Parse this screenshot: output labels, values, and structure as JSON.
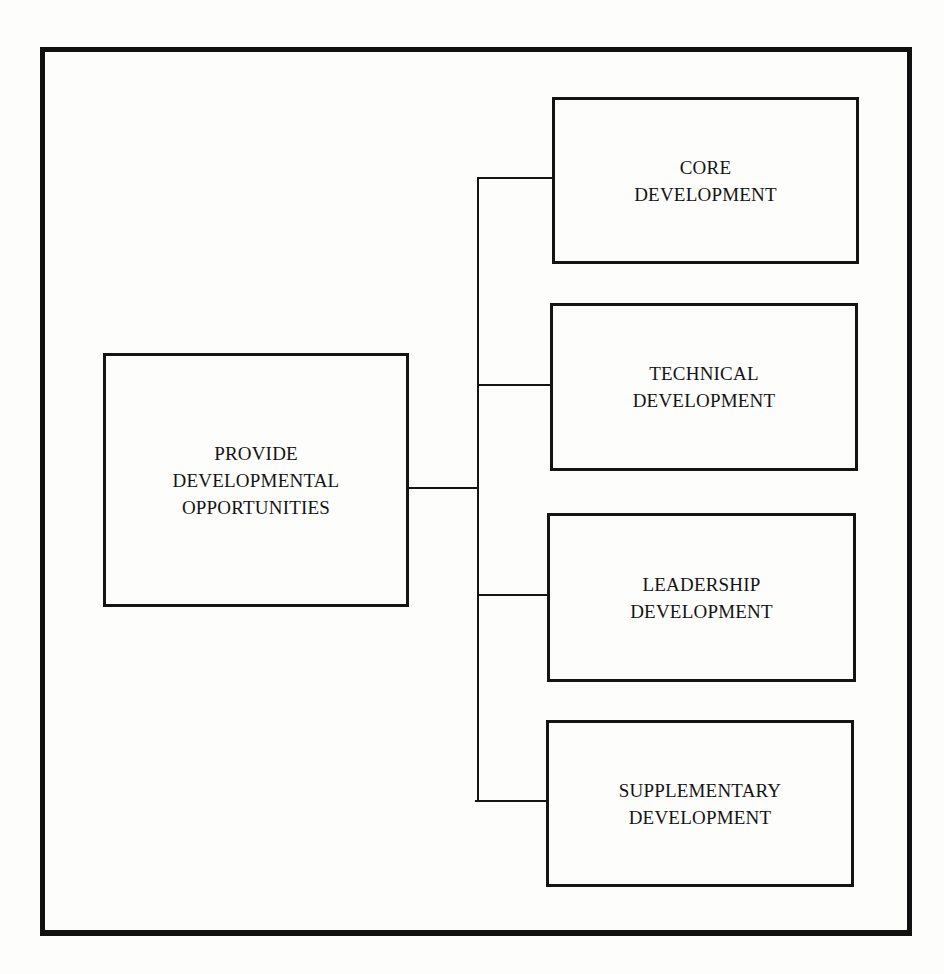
{
  "diagram": {
    "root": {
      "label": "PROVIDE\nDEVELOPMENTAL\nOPPORTUNITIES"
    },
    "children": [
      {
        "label": "CORE\nDEVELOPMENT"
      },
      {
        "label": "TECHNICAL\nDEVELOPMENT"
      },
      {
        "label": "LEADERSHIP\nDEVELOPMENT"
      },
      {
        "label": "SUPPLEMENTARY\nDEVELOPMENT"
      }
    ],
    "colors": {
      "line": "#141414",
      "background": "#fdfdfb"
    }
  }
}
